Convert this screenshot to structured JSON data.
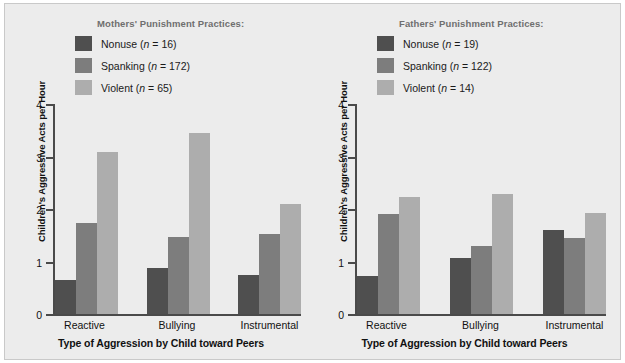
{
  "figure": {
    "background_color": "#ececec",
    "frame_color": "#c9c9c9"
  },
  "colors": {
    "nonuse": "#4f4f4f",
    "spanking": "#7d7d7d",
    "violent": "#adadad",
    "axis": "#4a4a4a",
    "legend_title": "#6f6f6f",
    "text": "#111111"
  },
  "panels": [
    {
      "id": "mothers",
      "legend_title": "Mothers' Punishment Practices:",
      "legend": [
        {
          "name": "Nonuse",
          "n": "16",
          "label": "Nonuse (n = 16)",
          "color_key": "nonuse",
          "swatch_color": "#4f4f4f"
        },
        {
          "name": "Spanking",
          "n": "172",
          "label": "Spanking (n = 172)",
          "color_key": "spanking",
          "swatch_color": "#7d7d7d"
        },
        {
          "name": "Violent",
          "n": "65",
          "label": "Violent (n = 65)",
          "color_key": "violent",
          "swatch_color": "#adadad"
        }
      ],
      "ylabel": "Children's Aggressive Acts per Hour",
      "xlabel": "Type of Aggression by Child toward Peers",
      "yticks": [
        "0",
        "1",
        "2",
        "3",
        "4"
      ],
      "xticks": [
        "Reactive",
        "Bullying",
        "Instrumental"
      ]
    },
    {
      "id": "fathers",
      "legend_title": "Fathers' Punishment Practices:",
      "legend": [
        {
          "name": "Nonuse",
          "n": "19",
          "label": "Nonuse (n = 19)",
          "color_key": "nonuse",
          "swatch_color": "#4f4f4f"
        },
        {
          "name": "Spanking",
          "n": "122",
          "label": "Spanking (n = 122)",
          "color_key": "spanking",
          "swatch_color": "#7d7d7d"
        },
        {
          "name": "Violent",
          "n": "14",
          "label": "Violent (n = 14)",
          "color_key": "violent",
          "swatch_color": "#adadad"
        }
      ],
      "ylabel": "Children's Aggressive Acts per Hour",
      "xlabel": "Type of Aggression by Child toward Peers",
      "yticks": [
        "0",
        "1",
        "2",
        "3",
        "4"
      ],
      "xticks": [
        "Reactive",
        "Bullying",
        "Instrumental"
      ]
    }
  ],
  "chart_data": [
    {
      "type": "bar",
      "title": "Mothers' Punishment Practices:",
      "xlabel": "Type of Aggression by Child toward Peers",
      "ylabel": "Children's Aggressive Acts per Hour",
      "categories": [
        "Reactive",
        "Bullying",
        "Instrumental"
      ],
      "ylim": [
        0,
        4
      ],
      "yticks": [
        0,
        1,
        2,
        3,
        4
      ],
      "grid": false,
      "legend_position": "top",
      "series": [
        {
          "name": "Nonuse (n = 16)",
          "color": "#4f4f4f",
          "values": [
            0.65,
            0.87,
            0.75
          ]
        },
        {
          "name": "Spanking (n = 172)",
          "color": "#7d7d7d",
          "values": [
            1.73,
            1.46,
            1.52
          ]
        },
        {
          "name": "Violent (n = 65)",
          "color": "#adadad",
          "values": [
            3.08,
            3.45,
            2.1
          ]
        }
      ]
    },
    {
      "type": "bar",
      "title": "Fathers' Punishment Practices:",
      "xlabel": "Type of Aggression by Child toward Peers",
      "ylabel": "Children's Aggressive Acts per Hour",
      "categories": [
        "Reactive",
        "Bullying",
        "Instrumental"
      ],
      "ylim": [
        0,
        4
      ],
      "yticks": [
        0,
        1,
        2,
        3,
        4
      ],
      "grid": false,
      "legend_position": "top",
      "series": [
        {
          "name": "Nonuse (n = 19)",
          "color": "#4f4f4f",
          "values": [
            0.72,
            1.07,
            1.6
          ]
        },
        {
          "name": "Spanking (n = 122)",
          "color": "#7d7d7d",
          "values": [
            1.9,
            1.3,
            1.45
          ]
        },
        {
          "name": "Violent (n = 14)",
          "color": "#adadad",
          "values": [
            2.22,
            2.28,
            1.92
          ]
        }
      ]
    }
  ]
}
